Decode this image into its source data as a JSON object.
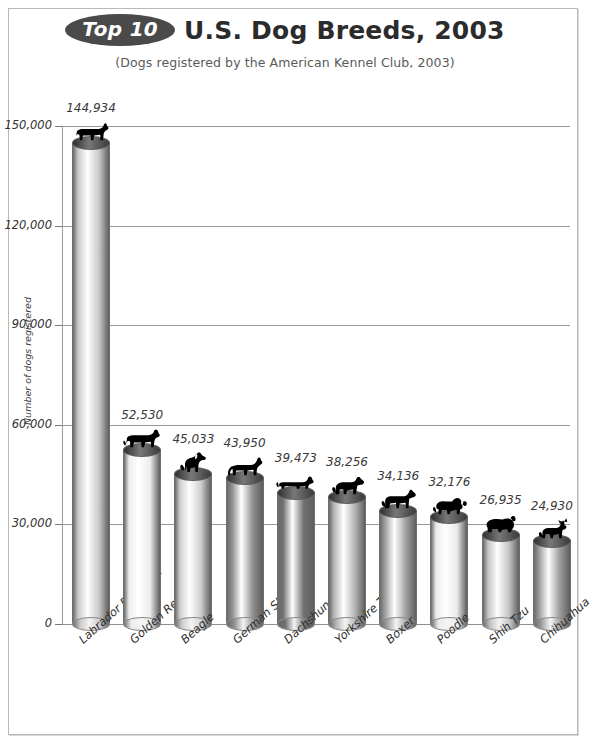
{
  "page": {
    "badge": "Top 10",
    "title": "U.S. Dog Breeds, 2003",
    "subtitle": "(Dogs registered by the American Kennel Club, 2003)"
  },
  "colors": {
    "badge_fill": "#4a4a4a",
    "badge_text": "#ffffff",
    "title_text": "#2b2b2b",
    "subtitle_text": "#5a5a5a",
    "gridline": "#9a9a9a",
    "frame_border": "#b8b8b8",
    "silhouette": "#000000",
    "background": "#ffffff"
  },
  "chart_data": {
    "type": "bar",
    "title": "Top 10 U.S. Dog Breeds, 2003",
    "subtitle": "(Dogs registered by the American Kennel Club, 2003)",
    "xlabel": "",
    "ylabel": "Number of dogs registered",
    "ylim": [
      0,
      150000
    ],
    "yticks": [
      0,
      30000,
      60000,
      90000,
      120000,
      150000
    ],
    "ytick_labels": [
      "0",
      "30,000",
      "60,000",
      "90,000",
      "120,000",
      "150,000"
    ],
    "grid": true,
    "legend": "none",
    "categories": [
      "Labrador Retriever",
      "Golden Retriever",
      "Beagle",
      "German Shepherd",
      "Dachshund",
      "Yorkshire Terrier",
      "Boxer",
      "Poodle",
      "Shih Tzu",
      "Chihuahua"
    ],
    "values": [
      144934,
      52530,
      45033,
      43950,
      39473,
      38256,
      34136,
      32176,
      26935,
      24930
    ],
    "value_labels": [
      "144,934",
      "52,530",
      "45,033",
      "43,950",
      "39,473",
      "38,256",
      "34,136",
      "32,176",
      "26,935",
      "24,930"
    ],
    "bar_style": "3d-cylinder",
    "bar_shades": [
      "#c9c9c9",
      "#ededed",
      "#cfcfcf",
      "#8e8e8e",
      "#6f6f6f",
      "#b5b5b5",
      "#a0a0a0",
      "#ebebeb",
      "#c4c4c4",
      "#9c9c9c"
    ],
    "marker_icons": [
      "labrador-retriever-silhouette",
      "golden-retriever-silhouette",
      "beagle-silhouette",
      "german-shepherd-silhouette",
      "dachshund-silhouette",
      "yorkshire-terrier-silhouette",
      "boxer-silhouette",
      "poodle-silhouette",
      "shih-tzu-silhouette",
      "chihuahua-silhouette"
    ]
  }
}
